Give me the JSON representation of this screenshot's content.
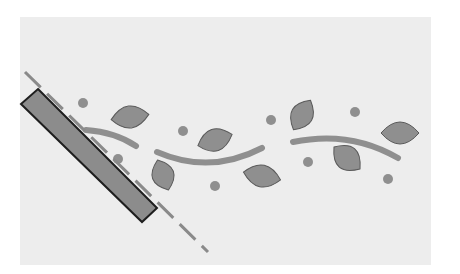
{
  "diagram": {
    "title": "",
    "background": {
      "x": 20,
      "y": 17,
      "w": 411,
      "h": 248,
      "color": "#ededed"
    },
    "colors": {
      "shape_fill": "#8f8f8f",
      "shape_stroke": "#5a5a5a",
      "rect_fill": "#8c8c8c",
      "rect_stroke": "#1e1e1e",
      "line": "#8a8a8a"
    },
    "cutting_line": {
      "x1": 25,
      "y1": 72,
      "x2": 208,
      "y2": 252,
      "style": "dashed"
    },
    "ruler_rect": {
      "points": "38,89 157,208 142,222 21,104"
    },
    "vines": [
      {
        "d": "M 86 130 Q 115 132 136 146"
      },
      {
        "d": "M 157 152 Q 210 175 262 148"
      },
      {
        "d": "M 293 142 Q 350 130 398 158"
      }
    ],
    "leaves": [
      {
        "cx": 130,
        "cy": 117,
        "rx": 19,
        "ry": 11,
        "rot": -8
      },
      {
        "cx": 163,
        "cy": 175,
        "rx": 16,
        "ry": 11,
        "rot": 70
      },
      {
        "cx": 215,
        "cy": 140,
        "rx": 18,
        "ry": 11,
        "rot": -18
      },
      {
        "cx": 262,
        "cy": 176,
        "rx": 19,
        "ry": 11,
        "rot": 12
      },
      {
        "cx": 302,
        "cy": 115,
        "rx": 17,
        "ry": 11,
        "rot": -60
      },
      {
        "cx": 347,
        "cy": 158,
        "rx": 17,
        "ry": 12,
        "rot": 40
      },
      {
        "cx": 400,
        "cy": 133,
        "rx": 19,
        "ry": 11,
        "rot": 0
      }
    ],
    "dots": [
      {
        "cx": 83,
        "cy": 103,
        "r": 5
      },
      {
        "cx": 183,
        "cy": 131,
        "r": 5
      },
      {
        "cx": 118,
        "cy": 159,
        "r": 5
      },
      {
        "cx": 215,
        "cy": 186,
        "r": 5
      },
      {
        "cx": 271,
        "cy": 120,
        "r": 5
      },
      {
        "cx": 308,
        "cy": 162,
        "r": 5
      },
      {
        "cx": 355,
        "cy": 112,
        "r": 5
      },
      {
        "cx": 388,
        "cy": 179,
        "r": 5
      }
    ]
  }
}
